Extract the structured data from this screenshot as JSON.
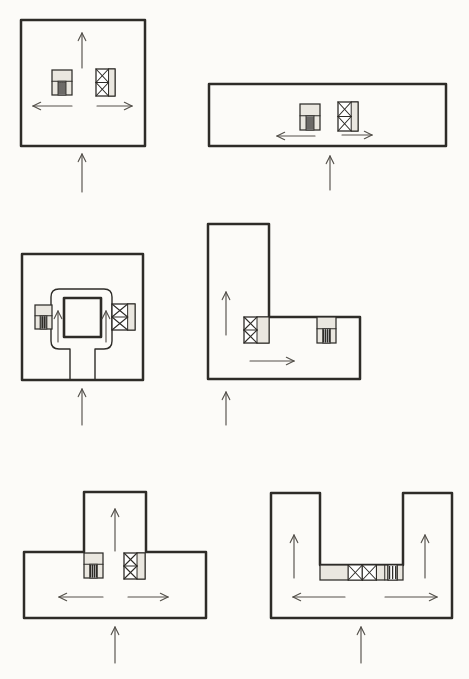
{
  "canvas": {
    "width": 469,
    "height": 679,
    "background": "#fcfbf8",
    "ink": "#2e2c28",
    "arrow_ink": "#54514b",
    "core_fill": "#eae7e0",
    "cell_fill": "#ffffff"
  },
  "figures": [
    {
      "id": "square-plan",
      "outline": {
        "points": [
          [
            21,
            20
          ],
          [
            145,
            20
          ],
          [
            145,
            146
          ],
          [
            21,
            146
          ]
        ],
        "width": 2.5
      },
      "cores": [
        {
          "type": "stair",
          "x": 52,
          "y": 70,
          "w": 20,
          "h": 25
        },
        {
          "type": "elevator",
          "x": 96,
          "y": 69,
          "w": 19,
          "h": 27,
          "xf": 0.66
        }
      ],
      "arrows": [
        {
          "role": "circulation",
          "x1": 82,
          "y1": 68,
          "x2": 82,
          "y2": 33
        },
        {
          "role": "circulation",
          "x1": 72,
          "y1": 106,
          "x2": 33,
          "y2": 106
        },
        {
          "role": "circulation",
          "x1": 97,
          "y1": 106,
          "x2": 132,
          "y2": 106
        },
        {
          "role": "entry",
          "x1": 82,
          "y1": 192,
          "x2": 82,
          "y2": 154
        }
      ]
    },
    {
      "id": "slab-plan",
      "outline": {
        "points": [
          [
            209,
            84
          ],
          [
            446,
            84
          ],
          [
            446,
            146
          ],
          [
            209,
            146
          ]
        ],
        "width": 2.5
      },
      "cores": [
        {
          "type": "stair",
          "x": 300,
          "y": 104,
          "w": 20,
          "h": 26
        },
        {
          "type": "elevator",
          "x": 338,
          "y": 102,
          "w": 20,
          "h": 29,
          "xf": 0.66
        }
      ],
      "arrows": [
        {
          "role": "circulation",
          "x1": 315,
          "y1": 136,
          "x2": 277,
          "y2": 136
        },
        {
          "role": "circulation",
          "x1": 342,
          "y1": 135,
          "x2": 372,
          "y2": 135
        },
        {
          "role": "entry",
          "x1": 330,
          "y1": 190,
          "x2": 330,
          "y2": 156
        }
      ]
    },
    {
      "id": "courtyard-plan",
      "outline": {
        "points": [
          [
            22,
            254
          ],
          [
            143,
            254
          ],
          [
            143,
            380
          ],
          [
            22,
            380
          ]
        ],
        "width": 2.5
      },
      "paths": [
        {
          "name": "corridor-ring",
          "d": "M 70 379 L 70 349 L 59 349 Q 51 349 51 341 L 51 297 Q 51 289 59 289 L 104 289 Q 112 289 112 297 L 112 341 Q 112 349 104 349 L 95 349 L 95 379",
          "width": 1.4
        },
        {
          "name": "courtyard-void",
          "d": "M 64 298 L 101 298 L 101 337 L 64 337 Z",
          "width": 2.6
        }
      ],
      "cores": [
        {
          "type": "stair",
          "x": 35,
          "y": 305,
          "w": 17,
          "h": 24
        },
        {
          "type": "elevator",
          "x": 112,
          "y": 304,
          "w": 23,
          "h": 26,
          "xf": 0.68
        }
      ],
      "arrows": [
        {
          "role": "circulation",
          "x1": 58,
          "y1": 342,
          "x2": 58,
          "y2": 311
        },
        {
          "role": "circulation",
          "x1": 106,
          "y1": 342,
          "x2": 106,
          "y2": 311
        },
        {
          "role": "entry",
          "x1": 82,
          "y1": 425,
          "x2": 82,
          "y2": 389
        }
      ]
    },
    {
      "id": "l-plan",
      "outline": {
        "points": [
          [
            208,
            224
          ],
          [
            269,
            224
          ],
          [
            269,
            317
          ],
          [
            360,
            317
          ],
          [
            360,
            379
          ],
          [
            208,
            379
          ]
        ],
        "width": 2.5
      },
      "cores": [
        {
          "type": "elevator",
          "x": 244,
          "y": 317,
          "w": 25,
          "h": 26,
          "xf": 0.52
        },
        {
          "type": "stair",
          "x": 317,
          "y": 317,
          "w": 19,
          "h": 26
        }
      ],
      "arrows": [
        {
          "role": "circulation",
          "x1": 226,
          "y1": 335,
          "x2": 226,
          "y2": 292
        },
        {
          "role": "circulation",
          "x1": 250,
          "y1": 361,
          "x2": 294,
          "y2": 361
        },
        {
          "role": "entry",
          "x1": 226,
          "y1": 425,
          "x2": 226,
          "y2": 392
        }
      ]
    },
    {
      "id": "t-plan",
      "outline": {
        "points": [
          [
            84,
            492
          ],
          [
            146,
            492
          ],
          [
            146,
            552
          ],
          [
            206,
            552
          ],
          [
            206,
            618
          ],
          [
            24,
            618
          ],
          [
            24,
            552
          ],
          [
            84,
            552
          ]
        ],
        "width": 2.5
      },
      "cores": [
        {
          "type": "stair",
          "x": 84,
          "y": 553,
          "w": 19,
          "h": 25
        },
        {
          "type": "elevator",
          "x": 124,
          "y": 553,
          "w": 21,
          "h": 26,
          "xf": 0.62
        }
      ],
      "arrows": [
        {
          "role": "circulation",
          "x1": 115,
          "y1": 551,
          "x2": 115,
          "y2": 509
        },
        {
          "role": "circulation",
          "x1": 103,
          "y1": 597,
          "x2": 59,
          "y2": 597
        },
        {
          "role": "circulation",
          "x1": 128,
          "y1": 597,
          "x2": 168,
          "y2": 597
        },
        {
          "role": "entry",
          "x1": 115,
          "y1": 663,
          "x2": 115,
          "y2": 627
        }
      ]
    },
    {
      "id": "u-plan",
      "outline": {
        "points": [
          [
            271,
            493
          ],
          [
            320,
            493
          ],
          [
            320,
            565
          ],
          [
            403,
            565
          ],
          [
            403,
            493
          ],
          [
            452,
            493
          ],
          [
            452,
            618
          ],
          [
            271,
            618
          ]
        ],
        "width": 2.5
      },
      "cores": [
        {
          "type": "strip",
          "x": 320,
          "y": 565,
          "w": 83,
          "h": 15,
          "segs": [
            {
              "t": "plain",
              "fw": 0.34
            },
            {
              "t": "x",
              "fw": 0.17
            },
            {
              "t": "x",
              "fw": 0.17
            },
            {
              "t": "plain",
              "fw": 0.1
            },
            {
              "t": "door",
              "fw": 0.04
            },
            {
              "t": "stair",
              "fw": 0.11
            },
            {
              "t": "plain",
              "fw": 0.07
            }
          ]
        }
      ],
      "arrows": [
        {
          "role": "circulation",
          "x1": 294,
          "y1": 578,
          "x2": 294,
          "y2": 535
        },
        {
          "role": "circulation",
          "x1": 425,
          "y1": 578,
          "x2": 425,
          "y2": 535
        },
        {
          "role": "circulation",
          "x1": 345,
          "y1": 597,
          "x2": 293,
          "y2": 597
        },
        {
          "role": "circulation",
          "x1": 385,
          "y1": 597,
          "x2": 437,
          "y2": 597
        },
        {
          "role": "entry",
          "x1": 361,
          "y1": 663,
          "x2": 361,
          "y2": 627
        }
      ]
    }
  ]
}
